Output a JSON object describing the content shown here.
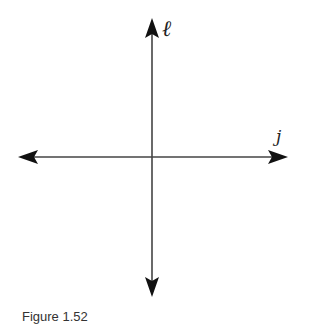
{
  "diagram": {
    "lines": [
      {
        "name": "l",
        "label": "ℓ",
        "orientation": "vertical"
      },
      {
        "name": "j",
        "label": "j",
        "orientation": "horizontal"
      }
    ],
    "line_color": "#333333"
  },
  "caption": "Figure 1.52"
}
